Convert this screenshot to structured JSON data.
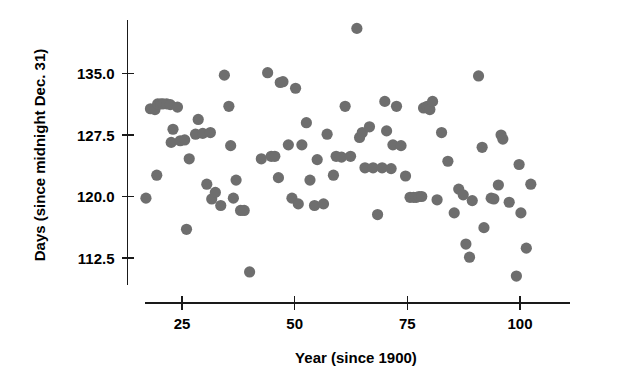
{
  "chart_data": {
    "type": "scatter",
    "title": "",
    "subtitle": "",
    "xlabel": "Year (since 1900)",
    "ylabel": "Days (since midnight Dec. 31)",
    "xlim": [
      15,
      112
    ],
    "ylim": [
      108.5,
      141.5
    ],
    "xticks": [
      25,
      50,
      75,
      100
    ],
    "xticklabels": [
      "25",
      "50",
      "75",
      "100"
    ],
    "yticks": [
      112.5,
      120.0,
      127.5,
      135.0
    ],
    "yticklabels": [
      "112.5",
      "120.0",
      "127.5",
      "135.0"
    ],
    "grid": false,
    "legend": null,
    "marker": {
      "shape": "circle",
      "color": "#6e6e6e",
      "size": 7.2
    },
    "annotations": [],
    "series": [
      {
        "name": "Ice breakup date",
        "color": "#6e6e6e",
        "points": [
          [
            17.0,
            119.8
          ],
          [
            18.0,
            130.7
          ],
          [
            19.0,
            130.6
          ],
          [
            19.6,
            131.3
          ],
          [
            20.3,
            131.3
          ],
          [
            20.8,
            131.3
          ],
          [
            21.6,
            131.3
          ],
          [
            22.4,
            131.2
          ],
          [
            19.4,
            122.6
          ],
          [
            23.0,
            128.2
          ],
          [
            22.6,
            126.6
          ],
          [
            24.0,
            130.9
          ],
          [
            24.6,
            126.8
          ],
          [
            25.6,
            126.9
          ],
          [
            26.0,
            116.0
          ],
          [
            26.6,
            124.6
          ],
          [
            28.0,
            127.6
          ],
          [
            28.6,
            129.4
          ],
          [
            29.6,
            127.7
          ],
          [
            30.5,
            121.5
          ],
          [
            31.3,
            127.8
          ],
          [
            31.6,
            119.7
          ],
          [
            32.4,
            120.5
          ],
          [
            33.6,
            118.9
          ],
          [
            34.4,
            134.8
          ],
          [
            35.4,
            131.0
          ],
          [
            35.8,
            126.2
          ],
          [
            36.4,
            119.8
          ],
          [
            37.0,
            122.0
          ],
          [
            38.0,
            118.3
          ],
          [
            38.8,
            118.3
          ],
          [
            40.0,
            110.8
          ],
          [
            42.6,
            124.6
          ],
          [
            44.0,
            135.1
          ],
          [
            44.8,
            124.9
          ],
          [
            45.6,
            124.9
          ],
          [
            46.4,
            122.3
          ],
          [
            46.8,
            133.9
          ],
          [
            47.4,
            134.0
          ],
          [
            48.6,
            126.3
          ],
          [
            49.4,
            119.8
          ],
          [
            50.2,
            133.2
          ],
          [
            50.8,
            119.1
          ],
          [
            51.6,
            126.3
          ],
          [
            52.6,
            129.0
          ],
          [
            53.4,
            122.0
          ],
          [
            54.4,
            118.9
          ],
          [
            55.0,
            124.5
          ],
          [
            56.4,
            119.1
          ],
          [
            57.2,
            127.6
          ],
          [
            58.6,
            122.6
          ],
          [
            59.2,
            124.9
          ],
          [
            60.4,
            124.8
          ],
          [
            61.2,
            131.0
          ],
          [
            62.4,
            124.9
          ],
          [
            63.8,
            140.5
          ],
          [
            64.4,
            127.2
          ],
          [
            65.0,
            127.8
          ],
          [
            65.6,
            123.5
          ],
          [
            66.6,
            128.5
          ],
          [
            67.4,
            123.5
          ],
          [
            68.4,
            117.8
          ],
          [
            69.4,
            123.5
          ],
          [
            70.4,
            128.0
          ],
          [
            70.0,
            131.6
          ],
          [
            71.4,
            123.4
          ],
          [
            71.8,
            126.3
          ],
          [
            72.6,
            131.0
          ],
          [
            73.6,
            126.2
          ],
          [
            74.6,
            122.5
          ],
          [
            75.6,
            119.9
          ],
          [
            76.4,
            119.9
          ],
          [
            77.0,
            119.9
          ],
          [
            77.6,
            120.0
          ],
          [
            78.2,
            120.0
          ],
          [
            78.6,
            130.8
          ],
          [
            79.4,
            131.0
          ],
          [
            80.0,
            130.6
          ],
          [
            80.6,
            131.6
          ],
          [
            81.6,
            119.6
          ],
          [
            82.6,
            127.8
          ],
          [
            84.0,
            124.3
          ],
          [
            85.4,
            118.0
          ],
          [
            86.4,
            120.9
          ],
          [
            87.4,
            120.2
          ],
          [
            88.0,
            114.2
          ],
          [
            88.8,
            112.6
          ],
          [
            89.4,
            119.5
          ],
          [
            90.8,
            134.7
          ],
          [
            91.6,
            126.0
          ],
          [
            92.0,
            116.2
          ],
          [
            93.6,
            119.8
          ],
          [
            94.2,
            119.7
          ],
          [
            95.2,
            121.4
          ],
          [
            95.8,
            127.5
          ],
          [
            96.2,
            127.0
          ],
          [
            97.6,
            119.3
          ],
          [
            99.2,
            110.3
          ],
          [
            100.2,
            118.0
          ],
          [
            101.4,
            113.7
          ],
          [
            102.4,
            121.5
          ],
          [
            99.8,
            123.9
          ]
        ]
      }
    ]
  },
  "axes": {
    "x_tick_labels": [
      "25",
      "50",
      "75",
      "100"
    ],
    "y_tick_labels": [
      "112.5",
      "120.0",
      "127.5",
      "135.0"
    ],
    "x_axis_title": "Year (since 1900)",
    "y_axis_title": "Days (since midnight Dec. 31)"
  }
}
